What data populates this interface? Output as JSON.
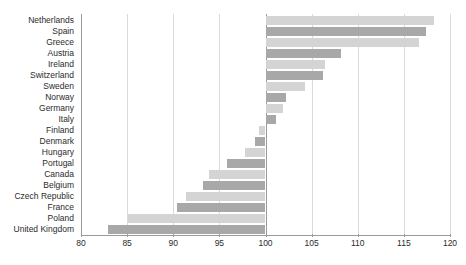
{
  "chart_data": {
    "type": "bar",
    "orientation": "horizontal",
    "title": "",
    "subtitle": "",
    "xlabel": "",
    "ylabel": "",
    "xlim": [
      80,
      120
    ],
    "ylim": null,
    "grid": true,
    "grid_axis": "x",
    "legend": null,
    "baseline": 100,
    "xticks": [
      80,
      85,
      90,
      95,
      100,
      105,
      110,
      115,
      120
    ],
    "xtick_labels": [
      "80",
      "85",
      "90",
      "95",
      "100",
      "105",
      "110",
      "115",
      "120"
    ],
    "categories": [
      "Netherlands",
      "Spain",
      "Greece",
      "Austria",
      "Ireland",
      "Switzerland",
      "Sweden",
      "Norway",
      "Germany",
      "Italy",
      "Finland",
      "Denmark",
      "Hungary",
      "Portugal",
      "Canada",
      "Belgium",
      "Czech Republic",
      "France",
      "Poland",
      "United Kingdom"
    ],
    "values": [
      118.3,
      117.4,
      116.6,
      108.2,
      106.5,
      106.2,
      104.3,
      102.2,
      101.9,
      101.1,
      99.3,
      98.9,
      97.8,
      95.8,
      93.9,
      93.2,
      91.4,
      90.4,
      85.1,
      82.9
    ],
    "bar_colors": [
      "#d4d4d4",
      "#a8a8a8",
      "#d4d4d4",
      "#a8a8a8",
      "#d4d4d4",
      "#a8a8a8",
      "#d4d4d4",
      "#a8a8a8",
      "#d4d4d4",
      "#a8a8a8",
      "#d4d4d4",
      "#a8a8a8",
      "#d4d4d4",
      "#a8a8a8",
      "#d4d4d4",
      "#a8a8a8",
      "#d4d4d4",
      "#a8a8a8",
      "#d4d4d4",
      "#a8a8a8"
    ],
    "colors": {
      "bar_light": "#d4d4d4",
      "bar_dark": "#a8a8a8",
      "gridline": "#d9d9d9",
      "axis": "#9b9b9b",
      "text": "#2b2b2b",
      "background": "#ffffff"
    }
  }
}
